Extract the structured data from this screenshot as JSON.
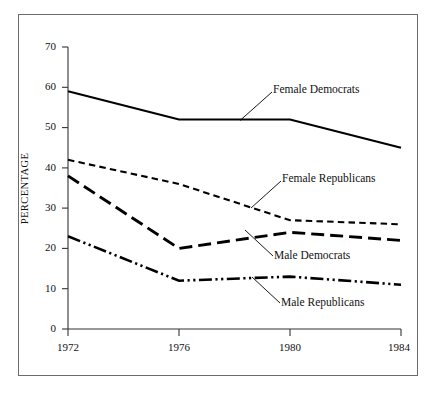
{
  "chart_data": {
    "type": "line",
    "title": "",
    "xlabel": "",
    "ylabel": "PERCENTAGE",
    "x": [
      1972,
      1976,
      1980,
      1984
    ],
    "xtick_labels": [
      "1972",
      "1976",
      "1980",
      "1984"
    ],
    "ytick_labels": [
      "0",
      "10",
      "20",
      "30",
      "40",
      "50",
      "60",
      "70"
    ],
    "ytick_values": [
      0,
      10,
      20,
      30,
      40,
      50,
      60,
      70
    ],
    "ylim": [
      0,
      70
    ],
    "xlim": [
      1972,
      1984
    ],
    "grid": false,
    "legend_position": "inline-annotations",
    "series": [
      {
        "name": "Female Democrats",
        "style": "solid",
        "values": [
          59,
          52,
          52,
          45
        ]
      },
      {
        "name": "Female Republicans",
        "style": "short-dashed",
        "values": [
          42,
          36,
          27,
          26
        ]
      },
      {
        "name": "Male Democrats",
        "style": "long-dashed",
        "values": [
          38,
          20,
          24,
          22
        ]
      },
      {
        "name": "Male Republicans",
        "style": "dash-dot-dot",
        "values": [
          23,
          12,
          13,
          11
        ]
      }
    ],
    "annotations": [
      {
        "text": "Female Democrats",
        "series": "Female Democrats"
      },
      {
        "text": "Female Republicans",
        "series": "Female Republicans"
      },
      {
        "text": "Male Democrats",
        "series": "Male Democrats"
      },
      {
        "text": "Male Republicans",
        "series": "Male Republicans"
      }
    ],
    "colors": {
      "line": "#000000",
      "axis": "#333333",
      "frame": "#6b6b6b",
      "background": "#ffffff"
    }
  },
  "axis": {
    "y_title": "PERCENTAGE",
    "y_ticks": [
      "70",
      "60",
      "50",
      "40",
      "30",
      "20",
      "10",
      "0"
    ],
    "x_ticks": [
      "1972",
      "1976",
      "1980",
      "1984"
    ]
  },
  "labels": {
    "female_democrats": "Female Democrats",
    "female_republicans": "Female Republicans",
    "male_democrats": "Male Democrats",
    "male_republicans": "Male Republicans"
  }
}
